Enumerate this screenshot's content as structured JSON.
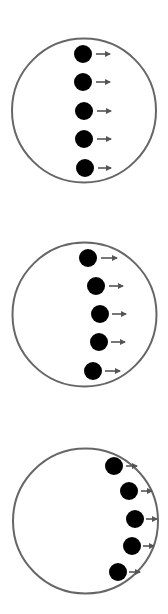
{
  "colors": {
    "background": "#ffffff",
    "circle_stroke": "#666666",
    "dot_fill": "#000000",
    "arrow": "#555555"
  },
  "panels": [
    {
      "id": "panel-1",
      "circle": {
        "cx": 84,
        "cy": 110.5,
        "r": 72
      },
      "dots": [
        {
          "cx": 83,
          "cy": 54,
          "r": 9,
          "arrow_x1": 96,
          "arrow_x2": 110
        },
        {
          "cx": 83,
          "cy": 82,
          "r": 9,
          "arrow_x1": 96,
          "arrow_x2": 110
        },
        {
          "cx": 84,
          "cy": 111,
          "r": 9,
          "arrow_x1": 97,
          "arrow_x2": 111
        },
        {
          "cx": 84,
          "cy": 139,
          "r": 9,
          "arrow_x1": 97,
          "arrow_x2": 111
        },
        {
          "cx": 85,
          "cy": 168,
          "r": 9,
          "arrow_x1": 98,
          "arrow_x2": 111
        }
      ]
    },
    {
      "id": "panel-2",
      "circle": {
        "cx": 84.5,
        "cy": 314.5,
        "r": 72
      },
      "dots": [
        {
          "cx": 88,
          "cy": 258,
          "r": 9,
          "arrow_x1": 101,
          "arrow_x2": 117
        },
        {
          "cx": 96,
          "cy": 286,
          "r": 9,
          "arrow_x1": 109,
          "arrow_x2": 123
        },
        {
          "cx": 100,
          "cy": 314,
          "r": 9,
          "arrow_x1": 112,
          "arrow_x2": 126
        },
        {
          "cx": 99,
          "cy": 342,
          "r": 9,
          "arrow_x1": 111,
          "arrow_x2": 125
        },
        {
          "cx": 93,
          "cy": 371,
          "r": 9,
          "arrow_x1": 105,
          "arrow_x2": 120
        }
      ]
    },
    {
      "id": "panel-3",
      "circle": {
        "cx": 85.5,
        "cy": 521,
        "r": 72.5
      },
      "dots": [
        {
          "cx": 114,
          "cy": 466,
          "r": 9,
          "arrow_x1": 126,
          "arrow_x2": 137
        },
        {
          "cx": 129,
          "cy": 491,
          "r": 9,
          "arrow_x1": 141,
          "arrow_x2": 152
        },
        {
          "cx": 135,
          "cy": 519,
          "r": 9,
          "arrow_x1": 146,
          "arrow_x2": 157
        },
        {
          "cx": 132,
          "cy": 546,
          "r": 9,
          "arrow_x1": 143,
          "arrow_x2": 154
        },
        {
          "cx": 118,
          "cy": 572,
          "r": 9,
          "arrow_x1": 129,
          "arrow_x2": 140
        }
      ]
    }
  ]
}
